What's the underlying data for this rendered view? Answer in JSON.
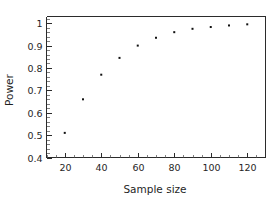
{
  "figure": {
    "background_color": "#ffffff",
    "foreground_color": "#1a1a1a",
    "marker_color": "#111111"
  },
  "axes": {
    "x_label": "Sample size",
    "y_label": "Power",
    "x_ticklabels": [
      "20",
      "40",
      "60",
      "80",
      "100",
      "120"
    ],
    "y_ticklabels": [
      "0.4",
      "0.5",
      "0.6",
      "0.7",
      "0.8",
      "0.9",
      "1"
    ]
  },
  "chart_data": {
    "type": "scatter",
    "title": "",
    "xlabel": "Sample size",
    "ylabel": "Power",
    "xlim": [
      10,
      130
    ],
    "ylim": [
      0.4,
      1.03
    ],
    "xticks": [
      20,
      40,
      60,
      80,
      100,
      120
    ],
    "yticks": [
      0.4,
      0.5,
      0.6,
      0.7,
      0.8,
      0.9,
      1.0
    ],
    "x_minor_tick_step": 5,
    "y_minor_tick_step": 0.02,
    "grid": false,
    "legend": null,
    "marker": "square",
    "marker_size": 2,
    "x": [
      20,
      30,
      40,
      50,
      60,
      70,
      80,
      90,
      100,
      110,
      120
    ],
    "y": [
      0.51,
      0.66,
      0.77,
      0.845,
      0.9,
      0.935,
      0.96,
      0.975,
      0.983,
      0.99,
      0.995
    ],
    "series": [
      {
        "name": "Power",
        "points": [
          {
            "x": 20,
            "y": 0.51
          },
          {
            "x": 30,
            "y": 0.66
          },
          {
            "x": 40,
            "y": 0.77
          },
          {
            "x": 50,
            "y": 0.845
          },
          {
            "x": 60,
            "y": 0.9
          },
          {
            "x": 70,
            "y": 0.935
          },
          {
            "x": 80,
            "y": 0.96
          },
          {
            "x": 90,
            "y": 0.975
          },
          {
            "x": 100,
            "y": 0.983
          },
          {
            "x": 110,
            "y": 0.99
          },
          {
            "x": 120,
            "y": 0.995
          }
        ]
      }
    ]
  }
}
